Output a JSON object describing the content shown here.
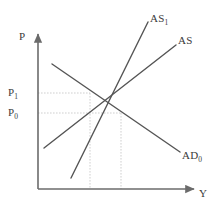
{
  "figure": {
    "name": "ad-as-diagram",
    "width": 216,
    "height": 209,
    "background": "#ffffff"
  },
  "style": {
    "curve_color": "#555555",
    "axis_color": "#6b6b6b",
    "guide_color": "#c9c9c9",
    "label_color": "#3b3b3b",
    "curve_width": 1.4,
    "axis_width": 1.6,
    "guide_width": 0.9
  },
  "axes": {
    "origin": {
      "x": 38,
      "y": 189
    },
    "vertical": {
      "name": "price-axis",
      "label": "P",
      "from": {
        "x": 38,
        "y": 189
      },
      "to": {
        "x": 38,
        "y": 32
      },
      "arrow": true
    },
    "horizontal": {
      "name": "output-axis",
      "label": "Y",
      "from": {
        "x": 38,
        "y": 189
      },
      "to": {
        "x": 196,
        "y": 189
      },
      "arrow": true
    }
  },
  "curves": [
    {
      "id": "as1",
      "name": "as1-curve",
      "label": "AS",
      "subscript": "1",
      "kind": "supply-shifted",
      "slope": "upward",
      "from": {
        "x": 71,
        "y": 178
      },
      "to": {
        "x": 148,
        "y": 22
      },
      "label_pos": {
        "x": 150,
        "y": 13
      }
    },
    {
      "id": "as",
      "name": "as-curve",
      "label": "AS",
      "subscript": "",
      "kind": "supply",
      "slope": "upward",
      "from": {
        "x": 44,
        "y": 148
      },
      "to": {
        "x": 176,
        "y": 45
      },
      "label_pos": {
        "x": 178,
        "y": 35
      }
    },
    {
      "id": "ad0",
      "name": "ad0-curve",
      "label": "AD",
      "subscript": "0",
      "kind": "demand",
      "slope": "downward",
      "from": {
        "x": 52,
        "y": 64
      },
      "to": {
        "x": 180,
        "y": 152
      },
      "label_pos": {
        "x": 182,
        "y": 150
      }
    }
  ],
  "equilibria": [
    {
      "id": "e1",
      "name": "equilibrium-point-1",
      "x": 90,
      "y": 93,
      "price_label": "P",
      "price_subscript": "1",
      "curves": [
        "as1",
        "ad0"
      ]
    },
    {
      "id": "e0",
      "name": "equilibrium-point-0",
      "x": 121,
      "y": 113,
      "price_label": "P",
      "price_subscript": "0",
      "curves": [
        "as",
        "ad0"
      ]
    }
  ],
  "guides": [
    {
      "name": "p1-horizontal-guide",
      "x1": 38,
      "y1": 93,
      "x2": 90,
      "y2": 93
    },
    {
      "name": "p0-horizontal-guide",
      "x1": 38,
      "y1": 113,
      "x2": 121,
      "y2": 113
    },
    {
      "name": "e1-vertical-guide",
      "x1": 90,
      "y1": 93,
      "x2": 90,
      "y2": 189
    },
    {
      "name": "e0-vertical-guide",
      "x1": 121,
      "y1": 113,
      "x2": 121,
      "y2": 189
    }
  ],
  "labels": {
    "price_axis": "P",
    "output_axis": "Y",
    "p1": "P",
    "p1_sub": "1",
    "p0": "P",
    "p0_sub": "0",
    "as1": "AS",
    "as1_sub": "1",
    "as": "AS",
    "as_sub": "",
    "ad0": "AD",
    "ad0_sub": "0"
  }
}
